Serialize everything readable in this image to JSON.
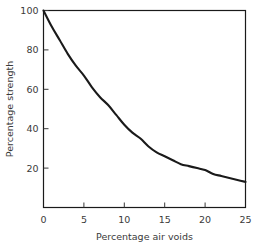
{
  "chart_data": {
    "type": "line",
    "title": "",
    "xlabel": "Percentage air voids",
    "ylabel": "Percentage strength",
    "xlim": [
      0,
      25
    ],
    "ylim": [
      0,
      100
    ],
    "grid": false,
    "legend": null,
    "xticks": [
      "0",
      "5",
      "10",
      "15",
      "20",
      "25"
    ],
    "xtick_values": [
      0,
      5,
      10,
      15,
      20,
      25
    ],
    "yticks": [
      "20",
      "40",
      "60",
      "80",
      "100"
    ],
    "ytick_values": [
      20,
      40,
      60,
      80,
      100
    ],
    "series": [
      {
        "name": "Percentage strength vs percentage air voids",
        "color": "#1a1a1a",
        "x": [
          0,
          1,
          2,
          3,
          4,
          5,
          6,
          7,
          8,
          9,
          10,
          11,
          12,
          13,
          14,
          15,
          16,
          17,
          18,
          19,
          20,
          21,
          22,
          23,
          24,
          25
        ],
        "y": [
          100,
          92,
          85,
          78,
          72,
          67,
          61,
          56,
          52,
          47,
          42,
          38,
          35,
          31,
          28,
          26,
          24,
          22,
          21,
          20,
          19,
          17,
          16,
          15,
          14,
          13
        ]
      }
    ]
  },
  "axis": {
    "frame_color": "#1a1a1a",
    "text_color": "#3a3a3a"
  }
}
